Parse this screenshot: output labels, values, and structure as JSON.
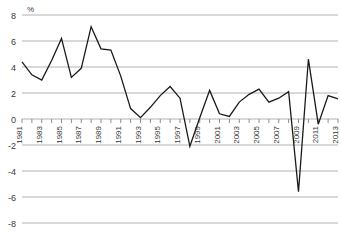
{
  "chart_data": {
    "type": "line",
    "title": "",
    "xlabel": "",
    "ylabel": "%",
    "unit_label": "%",
    "ylim": [
      -8,
      8
    ],
    "ytick_values": [
      8,
      6,
      4,
      2,
      0,
      -2,
      -4,
      -6,
      -8
    ],
    "ytick_labels": [
      "8",
      "6",
      "4",
      "2",
      "0",
      "-2",
      "-4",
      "-6",
      "-8"
    ],
    "grid": true,
    "grid_axis": "y",
    "legend": false,
    "legend_position": "none",
    "xtick_labels": [
      "1981",
      "1983",
      "1985",
      "1987",
      "1989",
      "1991",
      "1993",
      "1995",
      "1997",
      "1999",
      "2001",
      "2003",
      "2005",
      "2007",
      "2009",
      "2011",
      "2013"
    ],
    "xtick_label_rotation": -90,
    "x": [
      1981,
      1982,
      1983,
      1984,
      1985,
      1986,
      1987,
      1988,
      1989,
      1990,
      1991,
      1992,
      1993,
      1994,
      1995,
      1996,
      1997,
      1998,
      1999,
      2000,
      2001,
      2002,
      2003,
      2004,
      2005,
      2006,
      2007,
      2008,
      2009,
      2010,
      2011,
      2012,
      2013
    ],
    "categories": [
      "1981",
      "1982",
      "1983",
      "1984",
      "1985",
      "1986",
      "1987",
      "1988",
      "1989",
      "1990",
      "1991",
      "1992",
      "1993",
      "1994",
      "1995",
      "1996",
      "1997",
      "1998",
      "1999",
      "2000",
      "2001",
      "2002",
      "2003",
      "2004",
      "2005",
      "2006",
      "2007",
      "2008",
      "2009",
      "2010",
      "2011",
      "2012",
      "2013"
    ],
    "values": [
      4.4,
      3.4,
      3.0,
      4.5,
      6.2,
      3.2,
      3.9,
      7.1,
      5.4,
      5.3,
      3.3,
      0.8,
      0.1,
      0.9,
      1.8,
      2.5,
      1.6,
      -2.1,
      0.1,
      2.2,
      0.4,
      0.2,
      1.3,
      1.9,
      2.3,
      1.3,
      1.6,
      2.1,
      -5.6,
      4.6,
      -0.4,
      1.8,
      1.55
    ],
    "series": [
      {
        "name": "",
        "color": "#1a1a1a",
        "values": [
          4.4,
          3.4,
          3.0,
          4.5,
          6.2,
          3.2,
          3.9,
          7.1,
          5.4,
          5.3,
          3.3,
          0.8,
          0.1,
          0.9,
          1.8,
          2.5,
          1.6,
          -2.1,
          0.1,
          2.2,
          0.4,
          0.2,
          1.3,
          1.9,
          2.3,
          1.3,
          1.6,
          2.1,
          -5.6,
          4.6,
          -0.4,
          1.8,
          1.55
        ]
      }
    ],
    "colors": {
      "line": "#1a1a1a",
      "grid": "#b2b2b2",
      "axis": "#8c8c8c",
      "text": "#3a3a3a",
      "background": "#ffffff"
    }
  }
}
